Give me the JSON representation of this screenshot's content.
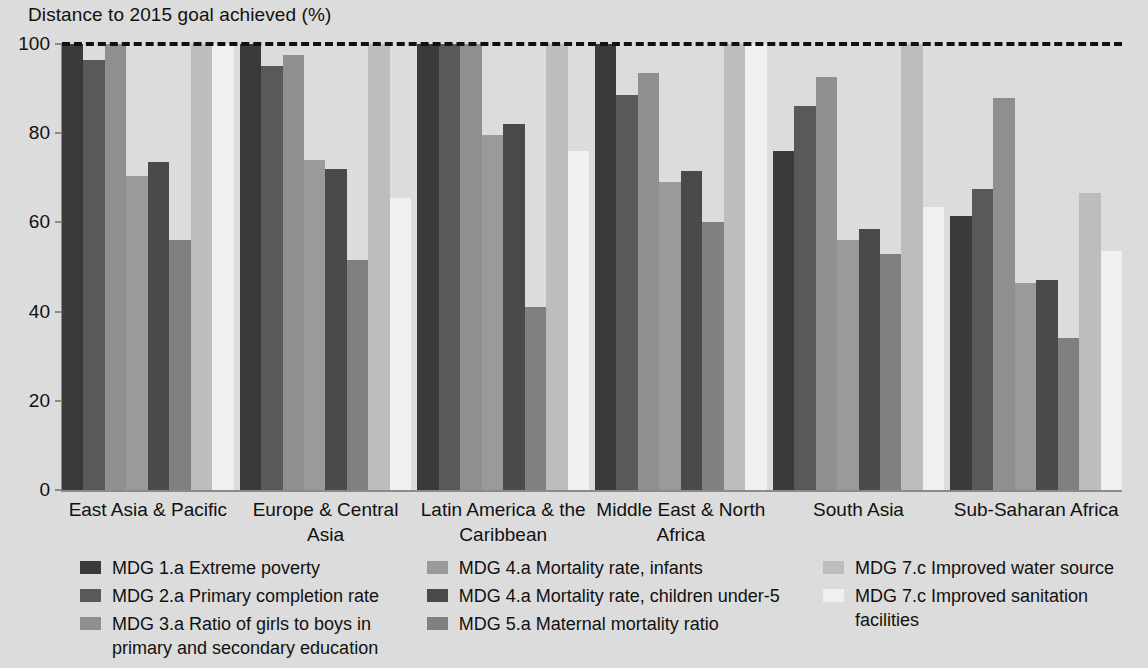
{
  "chart_data": {
    "type": "bar",
    "title": "Distance to 2015 goal achieved (%)",
    "xlabel": "",
    "ylabel": "",
    "ylim": [
      0,
      100
    ],
    "yticks": [
      0,
      20,
      40,
      60,
      80,
      100
    ],
    "grid": false,
    "legend_position": "bottom",
    "goal_line": {
      "value": 100,
      "style": "dashed",
      "color": "#111111"
    },
    "categories": [
      "East Asia & Pacific",
      "Europe & Central Asia",
      "Latin America & the Caribbean",
      "Middle East & North Africa",
      "South Asia",
      "Sub-Saharan Africa"
    ],
    "series": [
      {
        "name": "MDG 1.a Extreme poverty",
        "color": "#3a3a3a",
        "values": [
          100,
          100,
          100,
          100,
          76,
          61.5
        ]
      },
      {
        "name": "MDG 2.a Primary completion rate",
        "color": "#595959",
        "values": [
          96.5,
          95,
          100,
          88.5,
          86,
          67.5
        ]
      },
      {
        "name": "MDG 3.a Ratio of girls to boys in primary and secondary education",
        "color": "#8f8f8f",
        "values": [
          100,
          97.5,
          100,
          93.5,
          92.5,
          88
        ]
      },
      {
        "name": "MDG 4.a Mortality rate, infants",
        "color": "#9a9a9a",
        "values": [
          70.5,
          74,
          79.5,
          69,
          56,
          46.5
        ]
      },
      {
        "name": "MDG 4.a Mortality rate, children under-5",
        "color": "#4a4a4a",
        "values": [
          73.5,
          72,
          82,
          71.5,
          58.5,
          47
        ]
      },
      {
        "name": "MDG 5.a Maternal mortality ratio",
        "color": "#808080",
        "values": [
          56,
          51.5,
          41,
          60,
          53,
          34
        ]
      },
      {
        "name": "MDG 7.c Improved water source",
        "color": "#bdbdbd",
        "values": [
          100,
          100,
          100,
          100,
          100,
          66.5
        ]
      },
      {
        "name": "MDG 7.c Improved sanitation facilities",
        "color": "#f0f0f0",
        "values": [
          100,
          65.5,
          76,
          100,
          63.5,
          53.5
        ]
      }
    ]
  },
  "legend_columns": [
    [
      0,
      1,
      2
    ],
    [
      3,
      4,
      5
    ],
    [
      6,
      7
    ]
  ]
}
